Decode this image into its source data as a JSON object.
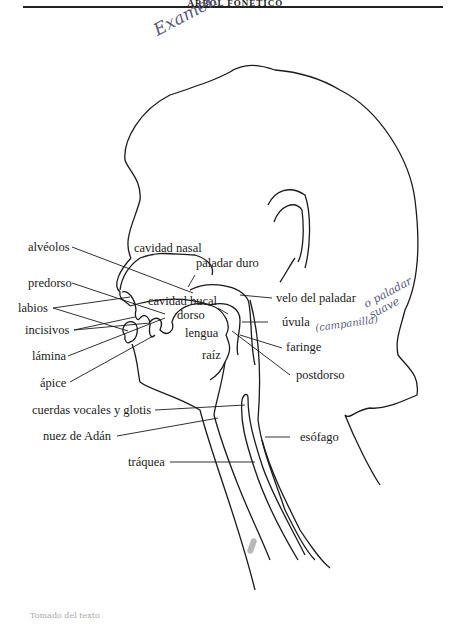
{
  "page": {
    "header_text": "ÁRBOL FONÉTICO",
    "handwritten_title": "Examen",
    "footer_scrap": "Tomado del texto"
  },
  "diagram": {
    "labels_left": [
      {
        "id": "alveolos",
        "text": "alvéolos"
      },
      {
        "id": "predorso",
        "text": "predorso"
      },
      {
        "id": "labios",
        "text": "labios"
      },
      {
        "id": "incisivos",
        "text": "incisivos"
      },
      {
        "id": "lamina",
        "text": "lámina"
      },
      {
        "id": "apice",
        "text": "ápice"
      },
      {
        "id": "cuerdas",
        "text": "cuerdas vocales y glotis"
      },
      {
        "id": "nuez",
        "text": "nuez de Adán"
      },
      {
        "id": "traquea",
        "text": "tráquea"
      }
    ],
    "labels_inner": [
      {
        "id": "cavidad_nasal",
        "text": "cavidad nasal"
      },
      {
        "id": "paladar_duro",
        "text": "paladar duro"
      },
      {
        "id": "cavidad_bucal",
        "text": "cavidad bucal"
      },
      {
        "id": "dorso",
        "text": "dorso"
      },
      {
        "id": "lengua",
        "text": "lengua"
      },
      {
        "id": "raiz",
        "text": "raíz"
      }
    ],
    "labels_right": [
      {
        "id": "velo",
        "text": "velo del paladar"
      },
      {
        "id": "uvula",
        "text": "úvula"
      },
      {
        "id": "faringe",
        "text": "faringe"
      },
      {
        "id": "postdorso",
        "text": "postdorso"
      },
      {
        "id": "esofago",
        "text": "esófago"
      }
    ],
    "annotations": [
      {
        "id": "note_paladar",
        "text": "o paladar suave"
      },
      {
        "id": "note_uvula",
        "text": "(campanilla)"
      }
    ]
  }
}
